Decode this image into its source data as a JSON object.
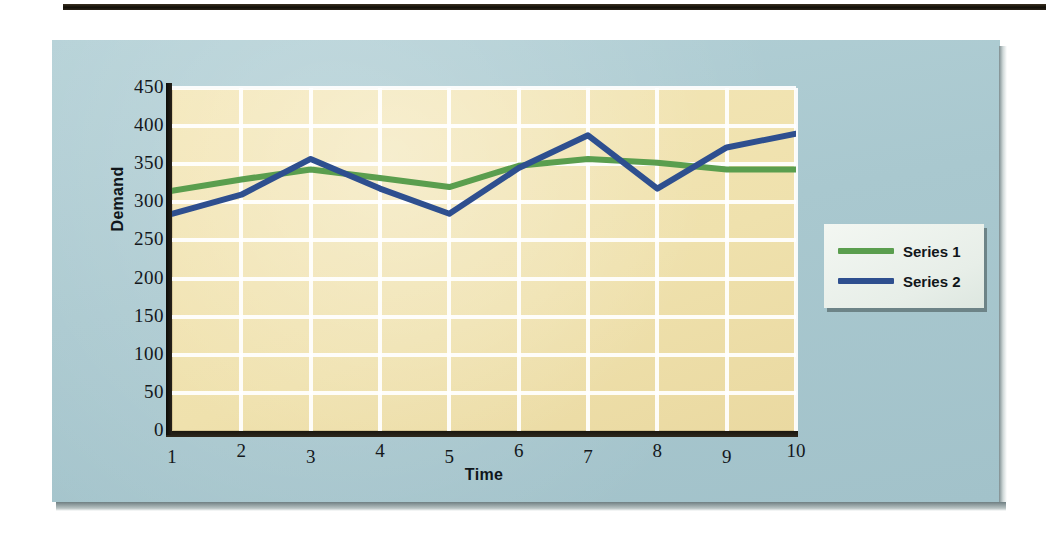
{
  "figure": {
    "panel_bg": "#a9c8cf",
    "plot_bg": "#efe1ad",
    "gridline_color": "#ffffff"
  },
  "legend": {
    "position": "right",
    "entries": [
      {
        "label": "Series 1",
        "color": "#5a9e4e"
      },
      {
        "label": "Series 2",
        "color": "#2e4f8f"
      }
    ]
  },
  "chart_data": {
    "type": "line",
    "title": "",
    "xlabel": "Time",
    "ylabel": "Demand",
    "x": [
      1,
      2,
      3,
      4,
      5,
      6,
      7,
      8,
      9,
      10
    ],
    "xticklabels": [
      "1",
      "2",
      "3",
      "4",
      "5",
      "6",
      "7",
      "8",
      "9",
      "10"
    ],
    "yticks": [
      0,
      50,
      100,
      150,
      200,
      250,
      300,
      350,
      400,
      450
    ],
    "yticklabels": [
      "0",
      "50",
      "100",
      "150",
      "200",
      "250",
      "300",
      "350",
      "400",
      "450"
    ],
    "xlim": [
      1,
      10
    ],
    "ylim": [
      0,
      450
    ],
    "grid": true,
    "legend_position": "right",
    "series": [
      {
        "name": "Series 1",
        "color": "#5a9e4e",
        "values": [
          315,
          330,
          343,
          332,
          320,
          348,
          357,
          352,
          343,
          343
        ]
      },
      {
        "name": "Series 2",
        "color": "#2e4f8f",
        "values": [
          285,
          310,
          357,
          318,
          285,
          345,
          388,
          318,
          372,
          390
        ]
      }
    ]
  }
}
